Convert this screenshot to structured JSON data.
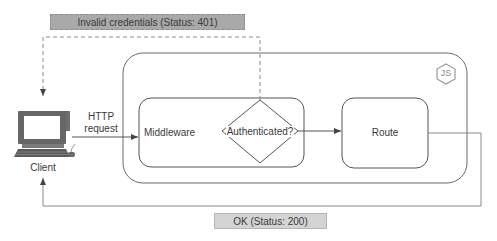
{
  "diagram": {
    "client": {
      "label": "Client",
      "icon": "desktop-computer-icon"
    },
    "http_request": {
      "line1": "HTTP",
      "line2": "request"
    },
    "server_container": {
      "icon": "nodejs-icon",
      "icon_text": "JS"
    },
    "middleware": {
      "label": "Middleware"
    },
    "decision": {
      "label": "Authenticated?"
    },
    "route": {
      "label": "Route"
    },
    "responses": {
      "error": {
        "label": "Invalid credentials (Status: 401)",
        "style": "dashed"
      },
      "success": {
        "label": "OK (Status: 200)",
        "style": "solid"
      }
    },
    "colors": {
      "stroke": "#555555",
      "light_stroke": "#8a8a8a",
      "error_badge_bg": "#a9a9a9",
      "ok_badge_bg": "#d4d4d4",
      "text": "#3a3a3a"
    }
  }
}
